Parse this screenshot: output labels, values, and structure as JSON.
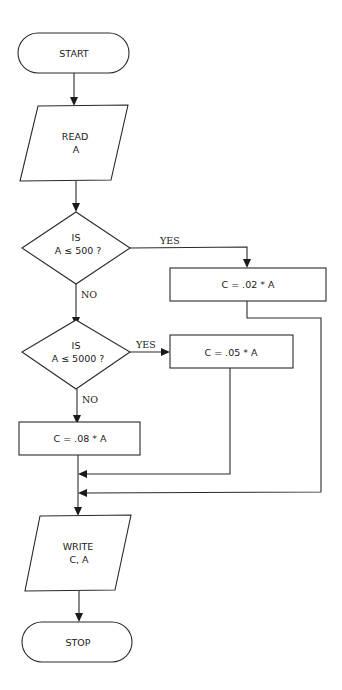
{
  "diagram": {
    "type": "flowchart",
    "header_fragment": "",
    "nodes": {
      "start": {
        "shape": "terminal",
        "label": "START"
      },
      "read": {
        "shape": "parallelogram",
        "line1": "READ",
        "line2": "A"
      },
      "decision1": {
        "shape": "diamond",
        "line1": "IS",
        "line2": "A ≤ 500 ?"
      },
      "calc1": {
        "shape": "rectangle",
        "label": "C = .02 * A"
      },
      "decision2": {
        "shape": "diamond",
        "line1": "IS",
        "line2": "A ≤ 5000 ?"
      },
      "calc2": {
        "shape": "rectangle",
        "label": "C = .05 * A"
      },
      "calc3": {
        "shape": "rectangle",
        "label": "C = .08 * A"
      },
      "write": {
        "shape": "parallelogram",
        "line1": "WRITE",
        "line2": "C, A"
      },
      "stop": {
        "shape": "terminal",
        "label": "STOP"
      }
    },
    "edge_labels": {
      "d1_yes": "YES",
      "d1_no": "NO",
      "d2_yes": "YES",
      "d2_no": "NO"
    },
    "edges": [
      {
        "from": "start",
        "to": "read"
      },
      {
        "from": "read",
        "to": "decision1"
      },
      {
        "from": "decision1",
        "to": "calc1",
        "label": "YES"
      },
      {
        "from": "decision1",
        "to": "decision2",
        "label": "NO"
      },
      {
        "from": "decision2",
        "to": "calc2",
        "label": "YES"
      },
      {
        "from": "decision2",
        "to": "calc3",
        "label": "NO"
      },
      {
        "from": "calc3",
        "to": "write"
      },
      {
        "from": "calc2",
        "to": "write"
      },
      {
        "from": "calc1",
        "to": "write"
      },
      {
        "from": "write",
        "to": "stop"
      }
    ]
  }
}
